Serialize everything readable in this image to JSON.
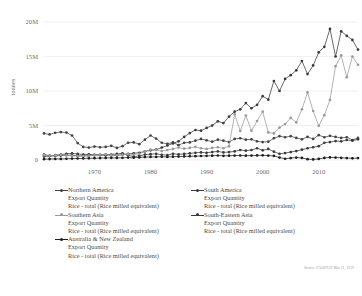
{
  "chart_data": {
    "type": "line",
    "title": "",
    "subtitle": "",
    "xlabel": "",
    "ylabel": "tonnes",
    "xlim": [
      1961,
      2017
    ],
    "ylim": [
      0,
      20000000
    ],
    "grid": true,
    "legend_position": "bottom",
    "y_ticks": [
      0,
      5000000,
      10000000,
      15000000,
      20000000
    ],
    "y_tick_labels": [
      "0",
      "5M",
      "10M",
      "15M",
      "20M"
    ],
    "x_ticks": [
      1970,
      1980,
      1990,
      2000,
      2010
    ],
    "x_tick_labels": [
      "1970",
      "1980",
      "1990",
      "2000",
      "2010"
    ],
    "x": [
      1961,
      1962,
      1963,
      1964,
      1965,
      1966,
      1967,
      1968,
      1969,
      1970,
      1971,
      1972,
      1973,
      1974,
      1975,
      1976,
      1977,
      1978,
      1979,
      1980,
      1981,
      1982,
      1983,
      1984,
      1985,
      1986,
      1987,
      1988,
      1989,
      1990,
      1991,
      1992,
      1993,
      1994,
      1995,
      1996,
      1997,
      1998,
      1999,
      2000,
      2001,
      2002,
      2003,
      2004,
      2005,
      2006,
      2007,
      2008,
      2009,
      2010,
      2011,
      2012,
      2013,
      2014,
      2015,
      2016,
      2017
    ],
    "series": [
      {
        "name": "Northern America",
        "item": "Export Quantity",
        "element": "Rice - total (Rice milled equivalent)",
        "color": "#444444",
        "marker": "circle",
        "values": [
          3850000,
          3700000,
          3950000,
          4050000,
          3980000,
          3550000,
          2450000,
          1900000,
          1800000,
          1950000,
          1850000,
          1900000,
          2050000,
          1750000,
          2000000,
          2500000,
          2550000,
          2300000,
          2950000,
          3550000,
          3100000,
          2500000,
          2350000,
          2550000,
          2150000,
          2500000,
          2550000,
          2800000,
          3050000,
          2850000,
          2650000,
          2950000,
          2800000,
          2600000,
          3050000,
          3150000,
          2950000,
          3000000,
          2700000,
          2600000,
          2650000,
          3150000,
          3450000,
          3300000,
          3450000,
          3200000,
          3000000,
          3350000,
          3050000,
          3600000,
          3300000,
          3500000,
          3350000,
          3200000,
          3300000,
          2900000,
          3200000
        ]
      },
      {
        "name": "South America",
        "item": "Export Quantity",
        "element": "Rice - total (Rice milled equivalent)",
        "color": "#3a3a3a",
        "marker": "circle",
        "values": [
          800000,
          620000,
          700000,
          780000,
          900000,
          950000,
          880000,
          800000,
          820000,
          750000,
          720000,
          680000,
          800000,
          880000,
          950000,
          680000,
          500000,
          600000,
          780000,
          850000,
          900000,
          760000,
          700000,
          900000,
          820000,
          880000,
          950000,
          1050000,
          1100000,
          1050000,
          1150000,
          1250000,
          1100000,
          1150000,
          1250000,
          1450000,
          1350000,
          1450000,
          1700000,
          1400000,
          1600000,
          1200000,
          900000,
          1000000,
          1150000,
          1300000,
          1500000,
          1700000,
          1850000,
          2000000,
          2500000,
          2600000,
          2750000,
          2700000,
          2900000,
          2800000,
          3000000
        ]
      },
      {
        "name": "Southern Asia",
        "item": "Export Quantity",
        "element": "Rice - total (Rice milled equivalent)",
        "color": "#3a3a3a",
        "marker": "circle",
        "values": [
          500000,
          560000,
          600000,
          640000,
          700000,
          680000,
          620000,
          600000,
          620000,
          700000,
          750000,
          800000,
          700000,
          660000,
          780000,
          900000,
          980000,
          1050000,
          1250000,
          1400000,
          1500000,
          1800000,
          2100000,
          2400000,
          2700000,
          3350000,
          3900000,
          4350000,
          4250000,
          4650000,
          5000000,
          5600000,
          5350000,
          6300000,
          7000000,
          7350000,
          8250000,
          7500000,
          8000000,
          9250000,
          8750000,
          11450000,
          10000000,
          11750000,
          12300000,
          13000000,
          14350000,
          12450000,
          13700000,
          15600000,
          16400000,
          19000000,
          15000000,
          18650000,
          18000000,
          17400000,
          16000000
        ]
      },
      {
        "name": "South-Eastern Asia",
        "item": "Export Quantity",
        "element": "Rice - total (Rice milled equivalent)",
        "color": "#9a9a9a",
        "marker": "circle",
        "values": [
          700000,
          620000,
          680000,
          750000,
          680000,
          600000,
          560000,
          580000,
          620000,
          700000,
          760000,
          800000,
          700000,
          660000,
          750000,
          850000,
          800000,
          900000,
          1250000,
          1500000,
          1450000,
          1300000,
          1450000,
          1600000,
          1800000,
          1650000,
          1750000,
          1900000,
          1700000,
          1600000,
          1750000,
          1850000,
          1700000,
          2000000,
          6600000,
          4200000,
          6450000,
          4250000,
          5650000,
          7000000,
          4000000,
          3850000,
          4700000,
          5200000,
          6100000,
          5450000,
          7350000,
          9800000,
          7100000,
          4950000,
          6500000,
          8700000,
          13600000,
          15150000,
          12000000,
          15000000,
          13800000
        ]
      },
      {
        "name": "Australia & New Zealand",
        "item": "Export Quantity",
        "element": "Rice - total (Rice milled equivalent)",
        "color": "#1f1f1f",
        "marker": "circle",
        "values": [
          120000,
          140000,
          160000,
          150000,
          180000,
          200000,
          220000,
          230000,
          250000,
          260000,
          280000,
          300000,
          310000,
          300000,
          320000,
          350000,
          330000,
          380000,
          420000,
          440000,
          450000,
          470000,
          440000,
          480000,
          500000,
          520000,
          540000,
          560000,
          580000,
          600000,
          620000,
          650000,
          600000,
          620000,
          640000,
          650000,
          630000,
          640000,
          660000,
          680000,
          640000,
          600000,
          350000,
          180000,
          280000,
          350000,
          300000,
          120000,
          90000,
          150000,
          300000,
          380000,
          350000,
          320000,
          280000,
          250000,
          280000
        ]
      }
    ]
  },
  "legend": {
    "entries": [
      {
        "name": "Northern America",
        "item": "Export Quantity",
        "element": "Rice - total (Rice milled equivalent)",
        "color": "#444444"
      },
      {
        "name": "South America",
        "item": "Export Quantity",
        "element": "Rice - total (Rice milled equivalent)",
        "color": "#3a3a3a"
      },
      {
        "name": "Southern Asia",
        "item": "Export Quantity",
        "element": "Rice - total (Rice milled equivalent)",
        "color": "#9a9a9a"
      },
      {
        "name": "South-Eastern Asia",
        "item": "Export Quantity",
        "element": "Rice - total (Rice milled equivalent)",
        "color": "#3a3a3a"
      },
      {
        "name": "Australia & New Zealand",
        "item": "Export Quantity",
        "element": "Rice - total (Rice milled equivalent)",
        "color": "#1f1f1f"
      }
    ]
  },
  "source": {
    "note": "Source: FAOSTAT Mar 11, 2019"
  }
}
